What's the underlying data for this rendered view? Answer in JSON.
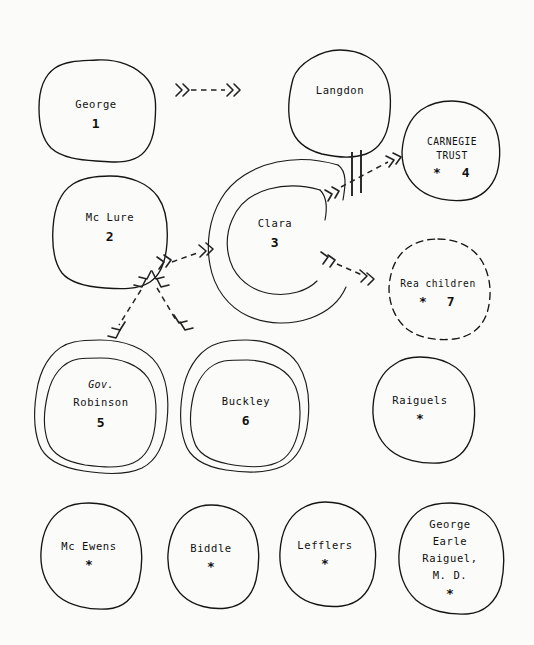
{
  "figure": {
    "type": "hand-drawn influence / kinship diagram",
    "background_color": "#fbfbfa",
    "ink_color": "#151515",
    "width": 534,
    "height": 645
  },
  "nodes": [
    {
      "id": "george",
      "name": "George",
      "number": "1",
      "star": "",
      "shape": "single-blob",
      "cx": 96,
      "cy": 110,
      "rx": 58,
      "ry": 50
    },
    {
      "id": "langdon",
      "name": "Langdon",
      "number": "",
      "star": "",
      "shape": "single-blob",
      "cx": 340,
      "cy": 102,
      "rx": 50,
      "ry": 52
    },
    {
      "id": "carnegie",
      "name": "CARNEGIE",
      "name2": "TRUST",
      "number": "4",
      "star": "*",
      "shape": "single-blob",
      "cx": 451,
      "cy": 150,
      "rx": 49,
      "ry": 50
    },
    {
      "id": "mclure",
      "name": "Mc Lure",
      "number": "2",
      "star": "",
      "shape": "single-blob",
      "cx": 110,
      "cy": 232,
      "rx": 57,
      "ry": 56
    },
    {
      "id": "clara",
      "name": "Clara",
      "number": "3",
      "star": "",
      "shape": "double-blob",
      "cx": 278,
      "cy": 233,
      "rx": 68,
      "ry": 66
    },
    {
      "id": "rea-children",
      "name": "Rea children",
      "number": "7",
      "star": "*",
      "shape": "dashed-blob",
      "cx": 438,
      "cy": 288,
      "rx": 53,
      "ry": 50
    },
    {
      "id": "gov-robinson",
      "name_italic": "Gov.",
      "name": "Robinson",
      "number": "5",
      "star": "",
      "shape": "double-blob",
      "cx": 101,
      "cy": 404,
      "rx": 66,
      "ry": 64
    },
    {
      "id": "buckley",
      "name": "Buckley",
      "number": "6",
      "star": "",
      "shape": "double-blob",
      "cx": 245,
      "cy": 405,
      "rx": 63,
      "ry": 65
    },
    {
      "id": "raiguels",
      "name": "Raiguels",
      "number": "",
      "star": "*",
      "shape": "single-blob",
      "cx": 420,
      "cy": 409,
      "rx": 53,
      "ry": 53
    },
    {
      "id": "mc-ewens",
      "name": "Mc Ewens",
      "number": "",
      "star": "*",
      "shape": "single-blob",
      "cx": 89,
      "cy": 555,
      "rx": 51,
      "ry": 52
    },
    {
      "id": "biddle",
      "name": "Biddle",
      "number": "",
      "star": "*",
      "shape": "single-blob",
      "cx": 211,
      "cy": 557,
      "rx": 46,
      "ry": 52
    },
    {
      "id": "lefflers",
      "name": "Lefflers",
      "number": "",
      "star": "*",
      "shape": "single-blob",
      "cx": 325,
      "cy": 554,
      "rx": 48,
      "ry": 52
    },
    {
      "id": "george-earle-raiguel",
      "name": "George",
      "name2": "Earle",
      "name3": "Raiguel,",
      "name4": "M. D.",
      "number": "",
      "star": "*",
      "shape": "single-blob",
      "cx": 450,
      "cy": 558,
      "rx": 52,
      "ry": 55
    }
  ],
  "edges": [
    {
      "id": "george-to-langdon",
      "from": "george",
      "to": "langdon",
      "style": "dashed-double-chevron",
      "heads": "both"
    },
    {
      "id": "mclure-to-clara",
      "from": "mclure",
      "to": "clara",
      "style": "dashed-double-chevron",
      "heads": "both"
    },
    {
      "id": "mclure-to-robinson",
      "from": "mclure",
      "to": "gov-robinson",
      "style": "dashed-double-chevron",
      "heads": "both"
    },
    {
      "id": "mclure-to-buckley",
      "from": "mclure",
      "to": "buckley",
      "style": "dashed-double-chevron",
      "heads": "both"
    },
    {
      "id": "clara-to-carnegie",
      "from": "clara",
      "to": "carnegie",
      "style": "dashed-double-chevron-severed",
      "heads": "both",
      "marker": "double-bar"
    },
    {
      "id": "clara-to-rea-children",
      "from": "clara",
      "to": "rea-children",
      "style": "dashed-double-chevron",
      "heads": "both"
    }
  ]
}
